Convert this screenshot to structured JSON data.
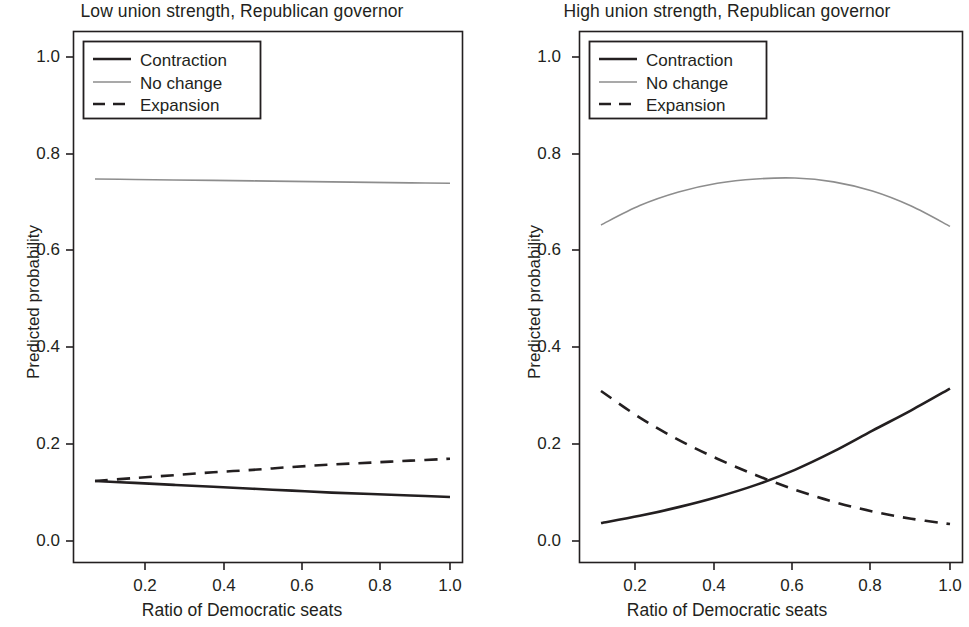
{
  "figure": {
    "width": 969,
    "height": 627,
    "background": "#ffffff",
    "ink_color": "#231f20",
    "nochange_color": "#8d8d8d"
  },
  "legend": {
    "position": "top-left inside axes",
    "entries": [
      {
        "label": "Contraction",
        "style": "solid",
        "color": "#231f20"
      },
      {
        "label": "No change",
        "style": "solid",
        "color": "#8d8d8d"
      },
      {
        "label": "Expansion",
        "style": "dashed",
        "color": "#231f20"
      }
    ]
  },
  "axes": {
    "xlabel": "Ratio of Democratic seats",
    "ylabel": "Predicted probability",
    "xticks": [
      "0.2",
      "0.4",
      "0.6",
      "0.8",
      "1.0"
    ],
    "xtick_values": [
      0.2,
      0.4,
      0.6,
      0.8,
      1.0
    ],
    "yticks": [
      "0.0",
      "0.2",
      "0.4",
      "0.6",
      "0.8",
      "1.0"
    ],
    "ytick_values": [
      0.0,
      0.2,
      0.4,
      0.6,
      0.8,
      1.0
    ],
    "xlim": [
      0.1,
      1.0
    ],
    "ylim": [
      -0.045,
      1.045
    ],
    "grid": false
  },
  "chart_data": [
    {
      "type": "line",
      "panel": "left",
      "title": "Low union strength, Republican governor",
      "xlabel": "Ratio of Democratic seats",
      "ylabel": "Predicted probability",
      "xlim": [
        0.1,
        1.0
      ],
      "ylim": [
        0.0,
        1.0
      ],
      "grid": false,
      "legend": [
        "Contraction",
        "No change",
        "Expansion"
      ],
      "x": [
        0.1,
        0.2,
        0.3,
        0.4,
        0.5,
        0.6,
        0.7,
        0.8,
        0.9,
        1.0
      ],
      "series": [
        {
          "name": "Contraction",
          "style": "solid",
          "color": "#231f20",
          "values": [
            0.124,
            0.12,
            0.116,
            0.112,
            0.108,
            0.104,
            0.1,
            0.097,
            0.094,
            0.091
          ]
        },
        {
          "name": "No change",
          "style": "solid",
          "color": "#8d8d8d",
          "values": [
            0.748,
            0.747,
            0.746,
            0.745,
            0.744,
            0.743,
            0.742,
            0.741,
            0.74,
            0.739
          ]
        },
        {
          "name": "Expansion",
          "style": "dashed",
          "color": "#231f20",
          "values": [
            0.124,
            0.13,
            0.136,
            0.142,
            0.147,
            0.153,
            0.158,
            0.162,
            0.166,
            0.17
          ]
        }
      ]
    },
    {
      "type": "line",
      "panel": "right",
      "title": "High union strength, Republican governor",
      "xlabel": "Ratio of Democratic seats",
      "ylabel": "Predicted probability",
      "xlim": [
        0.1,
        1.0
      ],
      "ylim": [
        0.0,
        1.0
      ],
      "grid": false,
      "legend": [
        "Contraction",
        "No change",
        "Expansion"
      ],
      "x": [
        0.1,
        0.2,
        0.3,
        0.4,
        0.5,
        0.6,
        0.7,
        0.8,
        0.9,
        1.0
      ],
      "series": [
        {
          "name": "Contraction",
          "style": "solid",
          "color": "#231f20",
          "values": [
            0.037,
            0.052,
            0.07,
            0.091,
            0.116,
            0.147,
            0.185,
            0.228,
            0.27,
            0.315
          ]
        },
        {
          "name": "No change",
          "style": "solid",
          "color": "#8d8d8d",
          "values": [
            0.653,
            0.693,
            0.721,
            0.739,
            0.748,
            0.75,
            0.742,
            0.723,
            0.692,
            0.65
          ]
        },
        {
          "name": "Expansion",
          "style": "dashed",
          "color": "#231f20",
          "values": [
            0.31,
            0.255,
            0.209,
            0.17,
            0.136,
            0.106,
            0.081,
            0.061,
            0.046,
            0.035
          ]
        }
      ],
      "annotations": [
        {
          "note": "Contraction and Expansion cross",
          "x": 0.54,
          "y": 0.125
        }
      ]
    }
  ],
  "panels": {
    "left": {
      "title": "Low union strength, Republican governor"
    },
    "right": {
      "title": "High union strength, Republican governor"
    }
  }
}
